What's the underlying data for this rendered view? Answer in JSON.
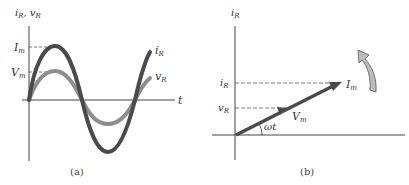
{
  "panel_a": {
    "caption": "(a)",
    "y_axis_label": "iR, vR",
    "y_axis_label_parts": {
      "i": "i",
      "i_sub": "R",
      "sep": ", ",
      "v": "v",
      "v_sub": "R"
    },
    "x_axis_label": "t",
    "tick_Im": {
      "main": "I",
      "sub": "m"
    },
    "tick_Vm": {
      "main": "V",
      "sub": "m"
    },
    "curve_iR_label": {
      "main": "i",
      "sub": "R"
    },
    "curve_vR_label": {
      "main": "v",
      "sub": "R"
    },
    "colors": {
      "iR": "#4a4a4a",
      "vR": "#8e8e8e",
      "axis": "#444444"
    }
  },
  "panel_b": {
    "caption": "(b)",
    "y_axis_label": {
      "main": "i",
      "sub": "R"
    },
    "level_iR": {
      "main": "i",
      "sub": "R"
    },
    "level_vR": {
      "main": "v",
      "sub": "R"
    },
    "phasor_Im": {
      "main": "I",
      "sub": "m"
    },
    "phasor_Vm": {
      "main": "V",
      "sub": "m"
    },
    "angle_label": "ωt",
    "rotation_arrow": "counterclockwise-arrow",
    "colors": {
      "phasor": "#4a4a4a",
      "rotation_arrow_fill": "#bdbdbd",
      "rotation_arrow_stroke": "#555555"
    }
  }
}
